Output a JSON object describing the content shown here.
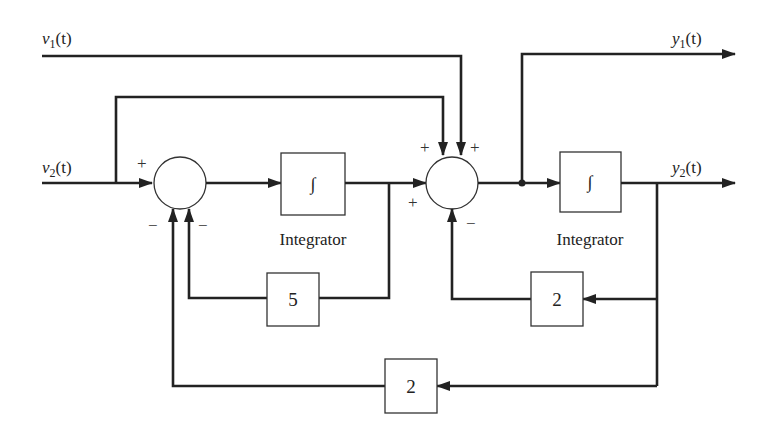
{
  "diagram": {
    "type": "block-diagram",
    "inputs": [
      {
        "id": "v1",
        "label_main": "v",
        "label_sub": "1",
        "label_arg": "(t)"
      },
      {
        "id": "v2",
        "label_main": "v",
        "label_sub": "2",
        "label_arg": "(t)"
      }
    ],
    "outputs": [
      {
        "id": "y1",
        "label_main": "y",
        "label_sub": "1",
        "label_arg": "(t)"
      },
      {
        "id": "y2",
        "label_main": "y",
        "label_sub": "2",
        "label_arg": "(t)"
      }
    ],
    "summing_junctions": [
      {
        "id": "sum1",
        "signs": {
          "left": "+",
          "bottom_left": "−",
          "bottom_right": "−"
        }
      },
      {
        "id": "sum2",
        "signs": {
          "top_left": "+",
          "top_right": "+",
          "left": "+",
          "bottom": "−"
        }
      }
    ],
    "blocks": [
      {
        "id": "int1",
        "symbol": "∫",
        "caption": "Integrator"
      },
      {
        "id": "int2",
        "symbol": "∫",
        "caption": "Integrator"
      },
      {
        "id": "gain5",
        "value": "5"
      },
      {
        "id": "gain2_inner",
        "value": "2"
      },
      {
        "id": "gain2_outer",
        "value": "2"
      }
    ]
  }
}
